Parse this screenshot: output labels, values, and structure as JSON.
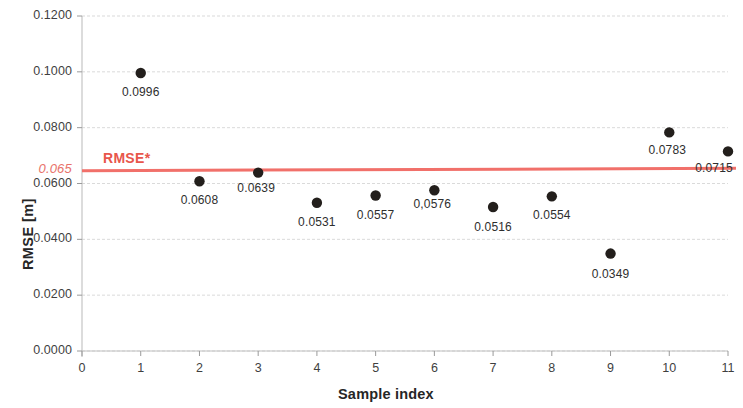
{
  "chart_data": {
    "type": "scatter",
    "title": "",
    "xlabel": "Sample index",
    "ylabel": "RMSE [m]",
    "xlim": [
      0,
      11
    ],
    "ylim": [
      0.0,
      0.12
    ],
    "grid": true,
    "legend_position": "none",
    "x": [
      1,
      2,
      3,
      4,
      5,
      6,
      7,
      8,
      9,
      10,
      11
    ],
    "values": [
      0.0996,
      0.0608,
      0.0639,
      0.0531,
      0.0557,
      0.0576,
      0.0516,
      0.0554,
      0.0349,
      0.0783,
      0.0715
    ],
    "point_labels": [
      "0.0996",
      "0.0608",
      "0.0639",
      "0.0531",
      "0.0557",
      "0,0576",
      "0.0516",
      "0.0554",
      "0.0349",
      "0.0783",
      "0.0715"
    ],
    "xticks": [
      0,
      1,
      2,
      3,
      4,
      5,
      6,
      7,
      8,
      9,
      10,
      11
    ],
    "xtick_labels": [
      "0",
      "1",
      "2",
      "3",
      "4",
      "5",
      "6",
      "7",
      "8",
      "9",
      "10",
      "11"
    ],
    "yticks": [
      0.0,
      0.02,
      0.04,
      0.06,
      0.08,
      0.1,
      0.12
    ],
    "ytick_labels": [
      "0.0000",
      "0.0200",
      "0.0400",
      "0.0600",
      "0.0800",
      "0.1000",
      "0.1200"
    ],
    "threshold": {
      "value": 0.065,
      "value_label": "0.065",
      "name_label": "RMSE*",
      "color": "#f1706a"
    },
    "point_color": "#231f1c",
    "grid_color": "#d9d9d9",
    "axis_color": "#bfbfbf"
  }
}
